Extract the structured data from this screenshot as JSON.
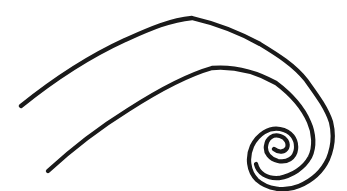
{
  "artwork": {
    "description": "Black line drawing of a breaking-wave style spiral: two parallel sweeping arcs curling into an inward spiral at the right end",
    "background_color": "#ffffff",
    "stroke_color": "#1a1a1a",
    "stroke_width": "4.3",
    "paths": {
      "outer_spiral": "M 21 106 C 52 81, 88 57, 125 40 C 150 29, 170 20, 192 18 C 218 24, 240 33, 260 44 C 278 55, 294 65, 306 80 C 316 94, 326 107, 331 122 C 334 134, 333 147, 328 159 C 322 172, 311 181, 299 186 C 284 192, 267 189, 257 180 C 248 171, 247 157, 252 146 C 258 134, 269 127, 280 129 C 291 131, 297 139, 296 149 C 295 158, 287 163, 278 161 C 270 159, 265 153, 266 146 C 267 138, 273 134, 280 136 C 286 138, 289 143, 287 148 C 285 152, 279 153, 274 149",
      "inner_arc": "M 48 171 C 72 149, 99 128, 128 110 C 156 92, 184 76, 212 68 C 236 66, 258 73, 276 83 C 292 95, 303 108, 309 122 C 314 133, 315 147, 310 157 C 304 168, 292 176, 279 178 C 267 179, 258 173, 256 164"
    }
  }
}
